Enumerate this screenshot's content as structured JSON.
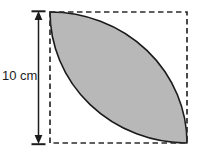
{
  "figure": {
    "type": "geometry-diagram",
    "dimension_label": "10 cm",
    "dimension_value": 10,
    "dimension_unit": "cm",
    "square": {
      "side_label": "10 cm",
      "border_style": "dashed",
      "x": 50,
      "y": 12,
      "width": 137,
      "height": 131
    },
    "shaded_region": {
      "name": "lens",
      "fill_color": "#b8b8b8",
      "stroke_color": "#1a1a1a",
      "arc_1": "quarter circle centered at bottom-left corner",
      "arc_2": "quarter circle centered at top-right corner"
    },
    "dimension_line": {
      "orientation": "vertical",
      "x": 38,
      "y_top": 12,
      "y_bottom": 143,
      "arrowheads": "both-ends",
      "color": "#1c1c1c"
    },
    "colors": {
      "background": "#ffffff",
      "fill": "#b8b8b8",
      "outline": "#1a1a1a",
      "dashed": "#2b2b2b",
      "text": "#1c1c1c"
    }
  }
}
